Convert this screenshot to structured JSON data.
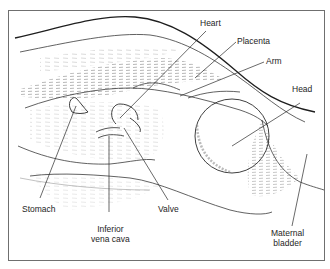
{
  "diagram": {
    "type": "ultrasound-scan-illustration",
    "labels": {
      "heart": "Heart",
      "placenta": "Placenta",
      "arm": "Arm",
      "head": "Head",
      "stomach": "Stomach",
      "ivc_line1": "Inferior",
      "ivc_line2": "vena cava",
      "valve": "Valve",
      "bladder_line1": "Maternal",
      "bladder_line2": "bladder"
    },
    "colors": {
      "line": "#1e1e1e",
      "thin_line": "#555555",
      "hatch": "#9a9a9a",
      "frame": "#6f6f6f"
    }
  }
}
